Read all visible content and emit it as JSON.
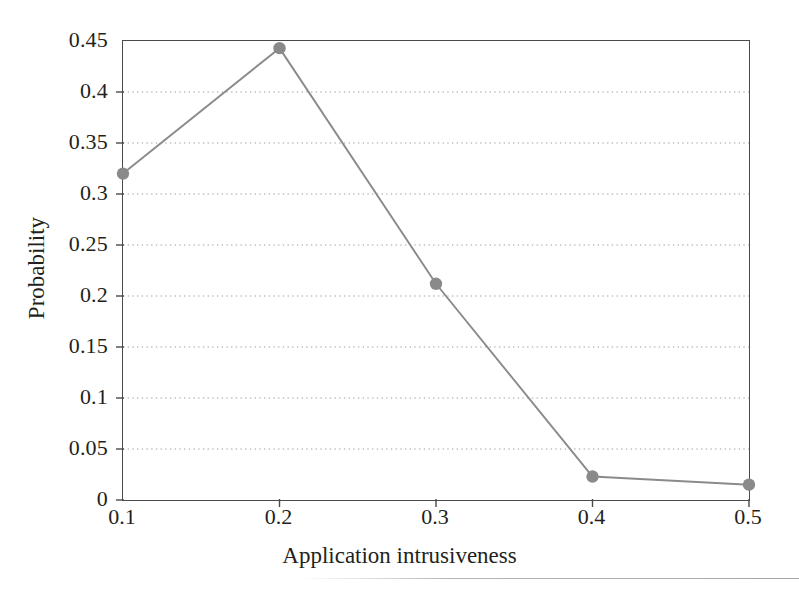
{
  "chart_data": {
    "type": "line",
    "title": "",
    "xlabel": "Application intrusiveness",
    "ylabel": "Probability",
    "x": [
      0.1,
      0.2,
      0.3,
      0.4,
      0.5
    ],
    "values": [
      0.32,
      0.443,
      0.212,
      0.023,
      0.015
    ],
    "series": [
      {
        "name": "Probability",
        "x": [
          0.1,
          0.2,
          0.3,
          0.4,
          0.5
        ],
        "values": [
          0.32,
          0.443,
          0.212,
          0.023,
          0.015
        ]
      }
    ],
    "xlim": [
      0.1,
      0.5
    ],
    "ylim": [
      0,
      0.45
    ],
    "xticks": [
      0.1,
      0.2,
      0.3,
      0.4,
      0.5
    ],
    "yticks": [
      0,
      0.05,
      0.1,
      0.15,
      0.2,
      0.25,
      0.3,
      0.35,
      0.4,
      0.45
    ],
    "xtick_labels": [
      "0.1",
      "0.2",
      "0.3",
      "0.4",
      "0.5"
    ],
    "ytick_labels": [
      "0",
      "0.05",
      "0.1",
      "0.15",
      "0.2",
      "0.25",
      "0.3",
      "0.35",
      "0.4",
      "0.45"
    ],
    "grid": "horizontal-dotted",
    "legend": "none",
    "marker": "circle",
    "line_color": "#8a8a8a",
    "marker_color": "#8a8a8a",
    "grid_color": "#9a9a9a",
    "axis_color": "#4a4a4a",
    "text_color": "#231f20"
  }
}
